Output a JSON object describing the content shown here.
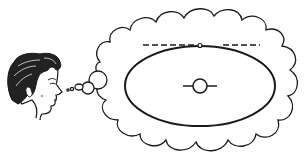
{
  "figure": {
    "colors": {
      "ink": "#1a1a1a",
      "background": "#ffffff",
      "hair": "#222222",
      "skin": "#ffffff"
    },
    "elements": {
      "thinker": "person-head",
      "thought_bubble": "cloud",
      "orbit": "ellipse",
      "central_body": "circle-with-axis",
      "orbiting_object": "small-circle",
      "tangent_line": "dashed-line"
    }
  }
}
